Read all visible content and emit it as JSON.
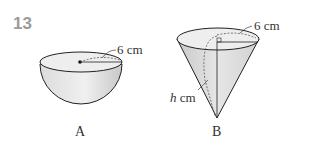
{
  "question_number": "13",
  "figures": [
    {
      "id": "A",
      "shape": "hemisphere",
      "label": "A",
      "radius_label": "6 cm"
    },
    {
      "id": "B",
      "shape": "cone",
      "label": "B",
      "radius_label": "6 cm",
      "slant_label_var": "h",
      "slant_label_unit": " cm"
    }
  ],
  "colors": {
    "outline": "#222222",
    "fill_light": "#e8e8e8",
    "fill_dark": "#c4c4c4",
    "question_number": "#9a9a9a"
  }
}
